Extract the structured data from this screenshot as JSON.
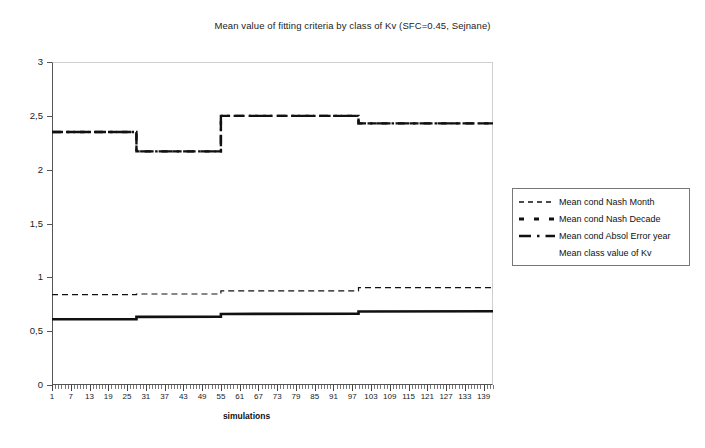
{
  "chart_data": {
    "type": "line",
    "title": "Mean value of fitting criteria by class of Kv (SFC=0.45, Sejnane)",
    "xlabel": "simulations",
    "ylabel": "",
    "xlim": [
      1,
      142
    ],
    "ylim": [
      0,
      3
    ],
    "grid": false,
    "legend_position": "right",
    "ytick_labels": [
      "0",
      "0,5",
      "1",
      "1,5",
      "2",
      "2,5",
      "3"
    ],
    "ytick_values": [
      0,
      0.5,
      1,
      1.5,
      2,
      2.5,
      3
    ],
    "xtick_labels": [
      "1",
      "7",
      "13",
      "19",
      "25",
      "31",
      "37",
      "43",
      "49",
      "55",
      "61",
      "67",
      "73",
      "79",
      "85",
      "91",
      "97",
      "103",
      "109",
      "115",
      "121",
      "127",
      "133",
      "139"
    ],
    "xtick_values": [
      1,
      7,
      13,
      19,
      25,
      31,
      37,
      43,
      49,
      55,
      61,
      67,
      73,
      79,
      85,
      91,
      97,
      103,
      109,
      115,
      121,
      127,
      133,
      139
    ],
    "x_minor_step": 1,
    "series": [
      {
        "name": "Mean cond  Nash Month",
        "style": "dashed",
        "width": 1.2,
        "color": "#111111",
        "x": [
          1,
          28,
          28,
          55,
          55,
          99,
          99,
          142
        ],
        "values": [
          0.84,
          0.84,
          0.845,
          0.845,
          0.875,
          0.875,
          0.905,
          0.905
        ]
      },
      {
        "name": "Mean cond Nash Decade",
        "style": "dashed-thick",
        "width": 2.4,
        "color": "#111111",
        "x": [
          1,
          28,
          28,
          55,
          55,
          99,
          99,
          142
        ],
        "values": [
          2.35,
          2.35,
          2.17,
          2.17,
          2.5,
          2.5,
          2.43,
          2.43
        ]
      },
      {
        "name": "Mean cond Absol Error year",
        "style": "dash-dot",
        "width": 2.4,
        "color": "#111111",
        "x": [
          1,
          28,
          28,
          55,
          55,
          99,
          99,
          142
        ],
        "values": [
          2.35,
          2.35,
          2.17,
          2.17,
          2.5,
          2.5,
          2.43,
          2.43
        ]
      },
      {
        "name": "Mean class value of Kv",
        "style": "solid",
        "width": 2.6,
        "color": "#111111",
        "x": [
          1,
          28,
          28,
          55,
          55,
          99,
          99,
          142
        ],
        "values": [
          0.61,
          0.612,
          0.633,
          0.635,
          0.66,
          0.663,
          0.683,
          0.685
        ]
      }
    ]
  },
  "legend": {
    "entries": [
      {
        "label": "Mean cond  Nash Month",
        "sample": "dashed"
      },
      {
        "label": "Mean cond Nash Decade",
        "sample": "dashed-thick"
      },
      {
        "label": "Mean cond Absol Error year",
        "sample": "dash-dot"
      },
      {
        "label": "Mean class value of Kv",
        "sample": "none"
      }
    ]
  }
}
